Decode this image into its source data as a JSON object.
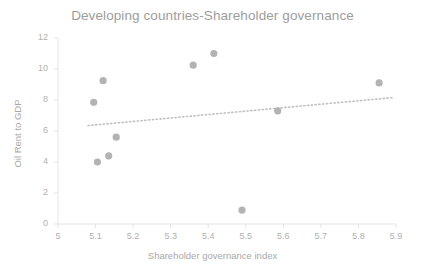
{
  "chart_data": {
    "type": "scatter",
    "title": "Developing countries-Shareholder governance",
    "xlabel": "Shareholder governance index",
    "ylabel": "Oil Rent to GDP",
    "xlim": [
      5,
      5.9
    ],
    "ylim": [
      0,
      12
    ],
    "xticks": [
      "5",
      "5.1",
      "5.2",
      "5.3",
      "5.4",
      "5.5",
      "5.6",
      "5.7",
      "5.8",
      "5.9"
    ],
    "xtick_values": [
      5,
      5.1,
      5.2,
      5.3,
      5.4,
      5.5,
      5.6,
      5.7,
      5.8,
      5.9
    ],
    "yticks": [
      "0",
      "2",
      "4",
      "6",
      "8",
      "10",
      "12"
    ],
    "ytick_values": [
      0,
      2,
      4,
      6,
      8,
      10,
      12
    ],
    "grid": false,
    "legend": "none",
    "marker_color": "#b3b3b3",
    "marker_size": 6,
    "trendline": {
      "type": "linear-dotted",
      "color": "#bfbfbf",
      "x_start": 5.08,
      "y_start": 6.35,
      "x_end": 5.89,
      "y_end": 8.15
    },
    "points": [
      {
        "x": 5.095,
        "y": 7.85
      },
      {
        "x": 5.105,
        "y": 4.0
      },
      {
        "x": 5.12,
        "y": 9.25
      },
      {
        "x": 5.135,
        "y": 4.4
      },
      {
        "x": 5.155,
        "y": 5.6
      },
      {
        "x": 5.36,
        "y": 10.25
      },
      {
        "x": 5.415,
        "y": 11.0
      },
      {
        "x": 5.49,
        "y": 0.9
      },
      {
        "x": 5.585,
        "y": 7.3
      },
      {
        "x": 5.855,
        "y": 9.1
      }
    ]
  }
}
